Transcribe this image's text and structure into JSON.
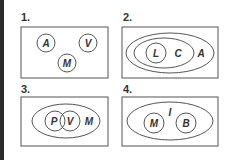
{
  "colors": {
    "stroke": "#555555",
    "text": "#333333",
    "edge": "#2a2a2a"
  },
  "panels": [
    {
      "number": "1.",
      "labels": {
        "a": "A",
        "b": "V",
        "c": "M"
      }
    },
    {
      "number": "2.",
      "labels": {
        "inner": "L",
        "middle": "C",
        "outer": "A"
      }
    },
    {
      "number": "3.",
      "labels": {
        "left": "P",
        "right": "V",
        "outer": "M"
      }
    },
    {
      "number": "4.",
      "labels": {
        "left": "M",
        "between": "I",
        "right": "B"
      }
    }
  ]
}
